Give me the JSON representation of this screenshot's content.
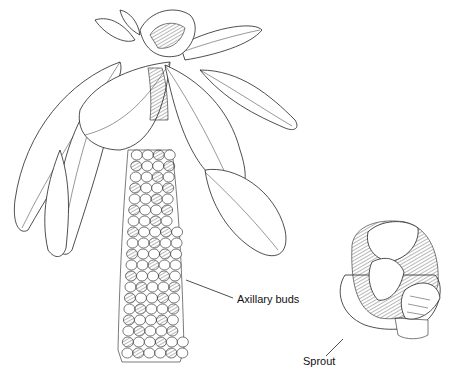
{
  "figure": {
    "labels": {
      "axillary_buds": "Axillary buds",
      "sprout": "Sprout"
    }
  },
  "colors": {
    "ink": "#222222",
    "background": "#ffffff"
  }
}
